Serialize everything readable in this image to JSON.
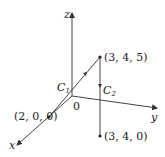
{
  "axes": {
    "x_label": "x",
    "y_label": "y",
    "z_label": "z",
    "origin_label": "0"
  },
  "points": [
    {
      "label": "(2, 0, 0)"
    },
    {
      "label": "(3, 4, 5)"
    },
    {
      "label": "(3, 4, 0)"
    }
  ],
  "curves": [
    {
      "name": "C",
      "sub": "1"
    },
    {
      "name": "C",
      "sub": "2"
    }
  ],
  "colors": {
    "line": "#444444",
    "text": "#222222"
  }
}
